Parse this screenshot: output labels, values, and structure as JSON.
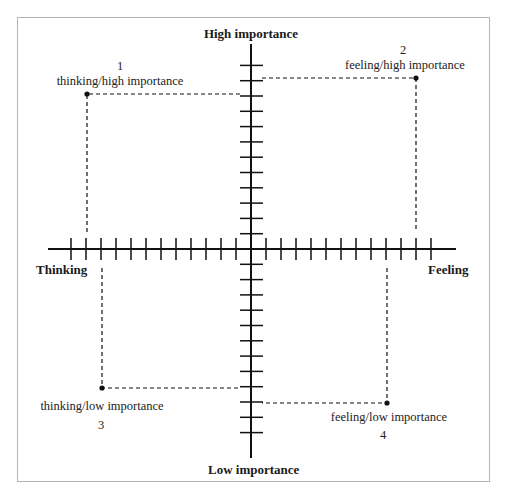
{
  "axes": {
    "top": "High importance",
    "bottom": "Low importance",
    "left": "Thinking",
    "right": "Feeling"
  },
  "quadrants": [
    {
      "number": "1",
      "label": "thinking/high importance"
    },
    {
      "number": "2",
      "label": "feeling/high importance"
    },
    {
      "number": "3",
      "label": "thinking/low importance"
    },
    {
      "number": "4",
      "label": "feeling/low importance"
    }
  ],
  "colors": {
    "line": "#111111",
    "frame": "#b5b5b5"
  }
}
